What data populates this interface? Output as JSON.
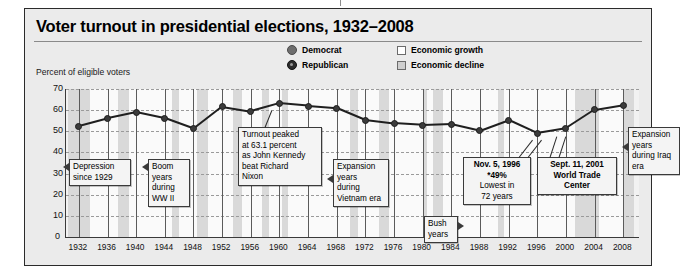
{
  "figure": {
    "title": "Voter turnout in presidential elections, 1932–2008",
    "axis_caption": "Percent of eligible voters"
  },
  "legend": {
    "democrat": "Democrat",
    "republican": "Republican",
    "economic_growth": "Economic growth",
    "economic_decline": "Economic decline"
  },
  "callouts": [
    {
      "id": "depression",
      "line1": "Depression",
      "line2": "since 1929"
    },
    {
      "id": "boom-wwii",
      "line1": "Boom",
      "line2": "years",
      "line3": "during",
      "line4": "WW II"
    },
    {
      "id": "kennedy-peak",
      "line1": "Turnout peaked",
      "line2": "at 63.1 percent",
      "line3": "as John Kennedy",
      "line4": "beat Richard",
      "line5": "Nixon"
    },
    {
      "id": "vietnam",
      "line1": "Expansion",
      "line2": "years",
      "line3": "during",
      "line4": "Vietnam era"
    },
    {
      "id": "bush-years",
      "line1": "Bush",
      "line2": "years"
    },
    {
      "id": "lowest-1996",
      "line1": "Nov. 5, 1996",
      "line2": "*49%",
      "line3": "Lowest in",
      "line4": "72 years"
    },
    {
      "id": "sept-11",
      "line1": "Sept. 11, 2001",
      "line2": "World Trade",
      "line3": "Center"
    },
    {
      "id": "iraq",
      "line1": "Expansion",
      "line2": "years",
      "line3": "during Iraq",
      "line4": "era"
    }
  ],
  "chart_data": {
    "type": "line",
    "title": "Voter turnout in presidential elections, 1932–2008",
    "xlabel": "",
    "ylabel": "Percent of eligible voters",
    "ylim": [
      0,
      70
    ],
    "yticks": [
      0,
      10,
      20,
      30,
      40,
      50,
      60,
      70
    ],
    "grid": true,
    "legend_position": "top-right",
    "categories": [
      1932,
      1936,
      1940,
      1944,
      1948,
      1952,
      1956,
      1960,
      1964,
      1968,
      1972,
      1976,
      1980,
      1984,
      1988,
      1992,
      1996,
      2000,
      2004,
      2008
    ],
    "values": [
      52.4,
      56.0,
      58.9,
      56.0,
      51.1,
      61.6,
      59.3,
      63.1,
      61.9,
      60.9,
      55.2,
      53.6,
      52.8,
      53.3,
      50.2,
      55.2,
      49.0,
      51.3,
      60.1,
      62.3
    ],
    "series": [
      {
        "name": "Voter turnout",
        "values": [
          52.4,
          56.0,
          58.9,
          56.0,
          51.1,
          61.6,
          59.3,
          63.1,
          61.9,
          60.9,
          55.2,
          53.6,
          52.8,
          53.3,
          50.2,
          55.2,
          49.0,
          51.3,
          60.1,
          62.3
        ],
        "winner_party": [
          "Democrat",
          "Democrat",
          "Democrat",
          "Democrat",
          "Democrat",
          "Republican",
          "Republican",
          "Democrat",
          "Democrat",
          "Republican",
          "Republican",
          "Democrat",
          "Republican",
          "Republican",
          "Republican",
          "Democrat",
          "Democrat",
          "Republican",
          "Republican",
          "Democrat"
        ]
      }
    ],
    "economy_bands": [
      {
        "from": 1930.5,
        "to": 1933.5,
        "state": "decline"
      },
      {
        "from": 1933.5,
        "to": 1937.5,
        "state": "growth"
      },
      {
        "from": 1937.5,
        "to": 1939.0,
        "state": "decline"
      },
      {
        "from": 1939.0,
        "to": 1945.0,
        "state": "growth"
      },
      {
        "from": 1945.0,
        "to": 1946.0,
        "state": "decline"
      },
      {
        "from": 1946.0,
        "to": 1948.5,
        "state": "growth"
      },
      {
        "from": 1948.5,
        "to": 1950.0,
        "state": "decline"
      },
      {
        "from": 1950.0,
        "to": 1953.5,
        "state": "growth"
      },
      {
        "from": 1953.5,
        "to": 1954.8,
        "state": "decline"
      },
      {
        "from": 1954.8,
        "to": 1957.5,
        "state": "growth"
      },
      {
        "from": 1957.5,
        "to": 1958.5,
        "state": "decline"
      },
      {
        "from": 1958.5,
        "to": 1960.3,
        "state": "growth"
      },
      {
        "from": 1960.3,
        "to": 1961.2,
        "state": "decline"
      },
      {
        "from": 1961.2,
        "to": 1969.9,
        "state": "growth"
      },
      {
        "from": 1969.9,
        "to": 1970.9,
        "state": "decline"
      },
      {
        "from": 1970.9,
        "to": 1973.9,
        "state": "growth"
      },
      {
        "from": 1973.9,
        "to": 1975.3,
        "state": "decline"
      },
      {
        "from": 1975.3,
        "to": 1980.0,
        "state": "growth"
      },
      {
        "from": 1980.0,
        "to": 1980.6,
        "state": "decline"
      },
      {
        "from": 1980.6,
        "to": 1981.5,
        "state": "growth"
      },
      {
        "from": 1981.5,
        "to": 1982.9,
        "state": "decline"
      },
      {
        "from": 1982.9,
        "to": 1990.5,
        "state": "growth"
      },
      {
        "from": 1990.5,
        "to": 1991.3,
        "state": "decline"
      },
      {
        "from": 1991.3,
        "to": 2001.2,
        "state": "growth"
      },
      {
        "from": 2001.2,
        "to": 2004.6,
        "state": "decline"
      },
      {
        "from": 2004.6,
        "to": 2007.9,
        "state": "growth"
      },
      {
        "from": 2007.9,
        "to": 2009.5,
        "state": "decline"
      }
    ]
  }
}
